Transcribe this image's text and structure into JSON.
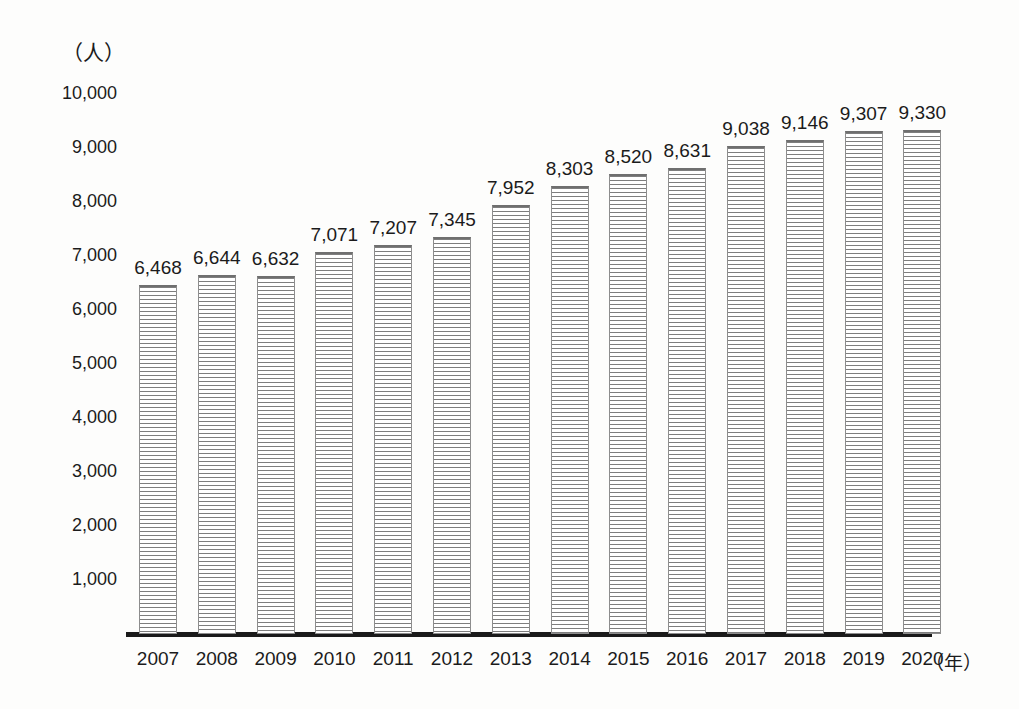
{
  "chart_data": {
    "type": "bar",
    "title": "",
    "subtitle": "",
    "xlabel": "（年）",
    "ylabel": "（人）",
    "categories": [
      "2007",
      "2008",
      "2009",
      "2010",
      "2011",
      "2012",
      "2013",
      "2014",
      "2015",
      "2016",
      "2017",
      "2018",
      "2019",
      "2020"
    ],
    "values": [
      6468,
      6644,
      6632,
      7071,
      7207,
      7345,
      7952,
      8303,
      8520,
      8631,
      9038,
      9146,
      9307,
      9330
    ],
    "value_labels": [
      "6,468",
      "6,644",
      "6,632",
      "7,071",
      "7,207",
      "7,345",
      "7,952",
      "8,303",
      "8,520",
      "8,631",
      "9,038",
      "9,146",
      "9,307",
      "9,330"
    ],
    "ylim": [
      0,
      10000
    ],
    "ytick_values": [
      10000,
      9000,
      8000,
      7000,
      6000,
      5000,
      4000,
      3000,
      2000,
      1000
    ],
    "ytick_labels": [
      "10,000",
      "9,000",
      "8,000",
      "7,000",
      "6,000",
      "5,000",
      "4,000",
      "3,000",
      "2,000",
      "1,000"
    ],
    "grid": false,
    "legend": false,
    "legend_position": "none",
    "bar_fill": "#ffffff",
    "bar_hatch": "horizontal-stripes",
    "bar_edge_color": "#8d8d8d",
    "axis_color": "#1a1a1a",
    "background_color": "#fdfdfc",
    "text_color": "#1b1b1b"
  },
  "axes": {
    "y_unit_caption": "（人）",
    "x_unit_caption": "（年）"
  }
}
